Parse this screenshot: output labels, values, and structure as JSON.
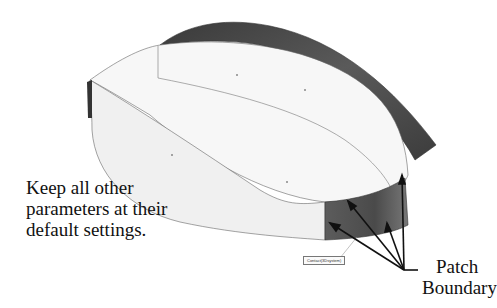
{
  "figure": {
    "note_lines": [
      "Keep all other",
      "parameters at their",
      "default settings."
    ],
    "callout_lines": [
      "Patch",
      "Boundary"
    ],
    "tag_label": "Contact(3Dsystem)",
    "colors": {
      "surface_light": "#f4f4f4",
      "surface_dark": "#4a4a4a",
      "edge": "#555555",
      "arrow": "#111111"
    }
  }
}
